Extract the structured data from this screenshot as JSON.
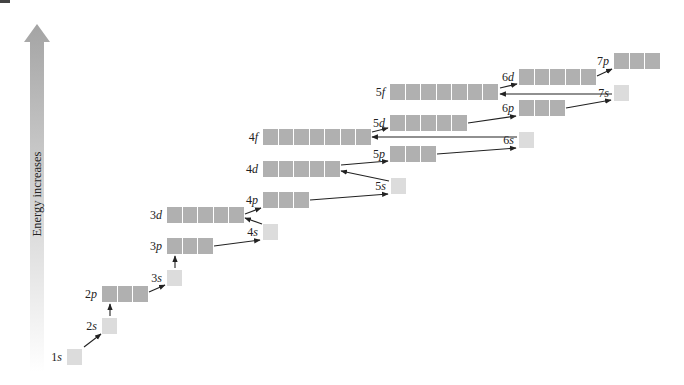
{
  "diagram": {
    "energy_axis_label": "Energy increases",
    "colors": {
      "filled_box": "#b0b0b0",
      "s_box": "#dcdcdc",
      "arrow_top": "#a4a4a4",
      "arrow_line": "#222222"
    },
    "subshells": [
      {
        "id": "1s",
        "n": "1",
        "l": "s",
        "boxes": 1,
        "x": 67,
        "y": 349
      },
      {
        "id": "2s",
        "n": "2",
        "l": "s",
        "boxes": 1,
        "x": 102,
        "y": 318
      },
      {
        "id": "2p",
        "n": "2",
        "l": "p",
        "boxes": 3,
        "x": 102,
        "y": 286
      },
      {
        "id": "3s",
        "n": "3",
        "l": "s",
        "boxes": 1,
        "x": 167,
        "y": 270
      },
      {
        "id": "3p",
        "n": "3",
        "l": "p",
        "boxes": 3,
        "x": 167,
        "y": 238
      },
      {
        "id": "4s",
        "n": "4",
        "l": "s",
        "boxes": 1,
        "x": 263,
        "y": 224
      },
      {
        "id": "3d",
        "n": "3",
        "l": "d",
        "boxes": 5,
        "x": 167,
        "y": 207
      },
      {
        "id": "4p",
        "n": "4",
        "l": "p",
        "boxes": 3,
        "x": 263,
        "y": 192
      },
      {
        "id": "5s",
        "n": "5",
        "l": "s",
        "boxes": 1,
        "x": 391,
        "y": 178
      },
      {
        "id": "4d",
        "n": "4",
        "l": "d",
        "boxes": 5,
        "x": 263,
        "y": 161
      },
      {
        "id": "5p",
        "n": "5",
        "l": "p",
        "boxes": 3,
        "x": 390,
        "y": 146
      },
      {
        "id": "6s",
        "n": "6",
        "l": "s",
        "boxes": 1,
        "x": 519,
        "y": 132
      },
      {
        "id": "4f",
        "n": "4",
        "l": "f",
        "boxes": 7,
        "x": 263,
        "y": 129
      },
      {
        "id": "5d",
        "n": "5",
        "l": "d",
        "boxes": 5,
        "x": 390,
        "y": 115
      },
      {
        "id": "6p",
        "n": "6",
        "l": "p",
        "boxes": 3,
        "x": 519,
        "y": 100
      },
      {
        "id": "7s",
        "n": "7",
        "l": "s",
        "boxes": 1,
        "x": 614,
        "y": 85
      },
      {
        "id": "5f",
        "n": "5",
        "l": "f",
        "boxes": 7,
        "x": 390,
        "y": 84
      },
      {
        "id": "6d",
        "n": "6",
        "l": "d",
        "boxes": 5,
        "x": 519,
        "y": 69
      },
      {
        "id": "7p",
        "n": "7",
        "l": "p",
        "boxes": 3,
        "x": 614,
        "y": 53
      }
    ],
    "filling_order": [
      "1s",
      "2s",
      "2p",
      "3s",
      "3p",
      "4s",
      "3d",
      "4p",
      "5s",
      "4d",
      "5p",
      "6s",
      "4f",
      "5d",
      "6p",
      "7s",
      "5f",
      "6d",
      "7p"
    ],
    "arrows": [
      {
        "from": "1s",
        "to": "2s",
        "x1": 84,
        "y1": 347,
        "x2": 101,
        "y2": 334
      },
      {
        "from": "2s",
        "to": "2p",
        "x1": 110,
        "y1": 316,
        "x2": 110,
        "y2": 304
      },
      {
        "from": "2p",
        "to": "3s",
        "x1": 149,
        "y1": 292,
        "x2": 165,
        "y2": 285
      },
      {
        "from": "3s",
        "to": "3p",
        "x1": 175,
        "y1": 268,
        "x2": 175,
        "y2": 256
      },
      {
        "from": "3p",
        "to": "4s",
        "x1": 214,
        "y1": 246,
        "x2": 260,
        "y2": 240
      },
      {
        "from": "4s",
        "to": "3d",
        "x1": 262,
        "y1": 224,
        "x2": 245,
        "y2": 218
      },
      {
        "from": "3d",
        "to": "4p",
        "x1": 245,
        "y1": 214,
        "x2": 261,
        "y2": 208
      },
      {
        "from": "4p",
        "to": "5s",
        "x1": 310,
        "y1": 200,
        "x2": 388,
        "y2": 194
      },
      {
        "from": "5s",
        "to": "4d",
        "x1": 389,
        "y1": 181,
        "x2": 341,
        "y2": 171
      },
      {
        "from": "4d",
        "to": "5p",
        "x1": 341,
        "y1": 165,
        "x2": 388,
        "y2": 161
      },
      {
        "from": "5p",
        "to": "6s",
        "x1": 437,
        "y1": 154,
        "x2": 516,
        "y2": 148
      },
      {
        "from": "6s",
        "to": "4f",
        "x1": 517,
        "y1": 137,
        "x2": 372,
        "y2": 137
      },
      {
        "from": "4f",
        "to": "5d",
        "x1": 372,
        "y1": 132,
        "x2": 388,
        "y2": 128
      },
      {
        "from": "5d",
        "to": "6p",
        "x1": 468,
        "y1": 123,
        "x2": 516,
        "y2": 116
      },
      {
        "from": "6p",
        "to": "7s",
        "x1": 566,
        "y1": 108,
        "x2": 611,
        "y2": 100
      },
      {
        "from": "7s",
        "to": "5f",
        "x1": 612,
        "y1": 94,
        "x2": 500,
        "y2": 94
      },
      {
        "from": "5f",
        "to": "6d",
        "x1": 500,
        "y1": 88,
        "x2": 517,
        "y2": 84
      },
      {
        "from": "6d",
        "to": "7p",
        "x1": 597,
        "y1": 76,
        "x2": 612,
        "y2": 69
      }
    ]
  }
}
